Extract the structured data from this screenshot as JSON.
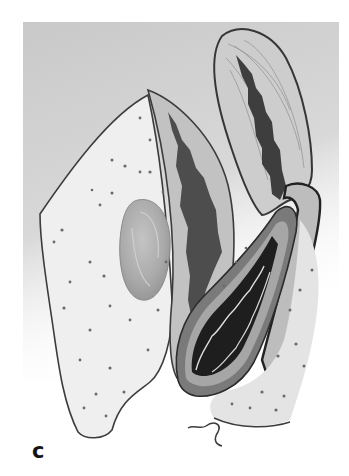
{
  "figure": {
    "panel_label": "c",
    "palette": {
      "background_wash": "#cfcfcf",
      "page": "#ffffff",
      "tissue_light": "#ececec",
      "tissue_mid": "#b9b9b9",
      "tissue_dark": "#5a5a5a",
      "lumen_black": "#1e1e1e",
      "outline": "#3c3c3c",
      "stipple": "#6a6a6a",
      "nodule": "#a9a9a9"
    }
  }
}
